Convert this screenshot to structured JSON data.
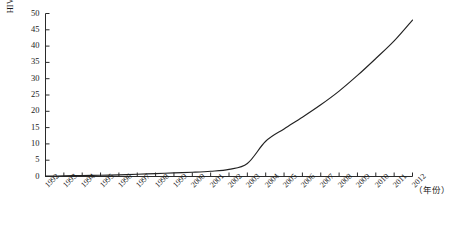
{
  "chart_data": {
    "type": "line",
    "title": "",
    "subtitle": "",
    "xlabel": "（年份）",
    "ylabel": "HIV/AIDS检出感染率（十万分之一）",
    "xlim": [
      1992,
      2012
    ],
    "ylim": [
      0,
      50
    ],
    "grid": false,
    "legend": null,
    "legend_position": "none",
    "y_tick_labels": [
      "0",
      "5",
      "10",
      "15",
      "20",
      "25",
      "30",
      "35",
      "40",
      "45",
      "50"
    ],
    "y_tick_values": [
      0,
      5,
      10,
      15,
      20,
      25,
      30,
      35,
      40,
      45,
      50
    ],
    "x_tick_labels": [
      "1992",
      "1993",
      "1994",
      "1995",
      "1996",
      "1997",
      "1998",
      "1999",
      "2000",
      "2001",
      "2002",
      "2003",
      "2004",
      "2005",
      "2006",
      "2007",
      "2008",
      "2009",
      "2010",
      "2011",
      "2012"
    ],
    "categories": [
      1992,
      1993,
      1994,
      1995,
      1996,
      1997,
      1998,
      1999,
      2000,
      2001,
      2002,
      2003,
      2004,
      2005,
      2006,
      2007,
      2008,
      2009,
      2010,
      2011,
      2012
    ],
    "series": [
      {
        "name": "HIV/AIDS检出感染率",
        "color": "#222222",
        "values": [
          0.1,
          0.2,
          0.3,
          0.4,
          0.5,
          0.7,
          0.9,
          1.1,
          1.3,
          1.6,
          2.2,
          4.0,
          10.8,
          14.6,
          18.2,
          22.0,
          26.2,
          31.0,
          36.2,
          41.6,
          48.0
        ]
      }
    ],
    "annotations": []
  },
  "axis": {
    "y_title": "HIV/AIDS检出感染率（十万分之一）",
    "x_title": "（年份）"
  }
}
